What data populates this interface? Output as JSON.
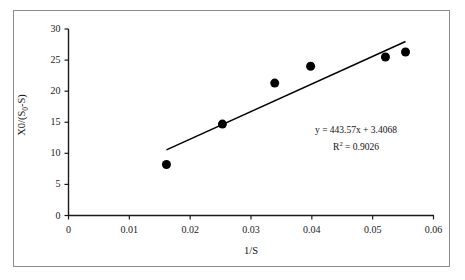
{
  "figure": {
    "border_color": "#8c8c8c",
    "background": "#ffffff"
  },
  "chart_data": {
    "type": "scatter",
    "title": "",
    "xlabel": "1/S",
    "ylabel_parts": {
      "prefix": "X0/(S",
      "subscript": "0",
      "suffix": "-S)"
    },
    "ylabel": "X0/(S0-S)",
    "xlim": [
      0,
      0.06
    ],
    "ylim": [
      0,
      30
    ],
    "xticks": [
      0,
      0.01,
      0.02,
      0.03,
      0.04,
      0.05,
      0.06
    ],
    "xtick_labels": [
      "0",
      "0.01",
      "0.02",
      "0.03",
      "0.04",
      "0.05",
      "0.06"
    ],
    "yticks": [
      0,
      5,
      10,
      15,
      20,
      25,
      30
    ],
    "ytick_labels": [
      "0",
      "5",
      "10",
      "15",
      "20",
      "25",
      "30"
    ],
    "grid": false,
    "legend": false,
    "marker": {
      "shape": "circle",
      "color": "#000000",
      "size_px": 9
    },
    "series": [
      {
        "name": "data",
        "x": [
          0.0161,
          0.0253,
          0.0339,
          0.0398,
          0.0521,
          0.0554
        ],
        "y": [
          8.2,
          14.7,
          21.3,
          24.0,
          25.5,
          26.3
        ]
      }
    ],
    "trendline": {
      "type": "linear",
      "slope": 443.57,
      "intercept": 3.4068,
      "r_squared": 0.9026,
      "color": "#000000",
      "x_start": 0.0161,
      "x_end": 0.0554,
      "equation_label": "y = 443.57x + 3.4068",
      "r2_label_prefix": "R",
      "r2_label_sup": "2",
      "r2_label_suffix": " = 0.9026"
    }
  },
  "annotations": {
    "equation": "y = 443.57x + 3.4068",
    "r_squared_text": "R2 = 0.9026"
  }
}
